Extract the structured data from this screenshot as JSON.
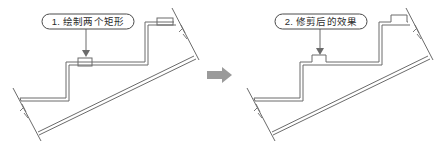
{
  "figure": {
    "background_color": "#ffffff",
    "line_color": "#6b6b6b",
    "dark_line_color": "#555555",
    "label_text_color": "#2b2b2b",
    "arrow_color": "#9a9a9a"
  },
  "panels": [
    {
      "id": "before",
      "step_number": "1.",
      "label": "1. 绘制两个矩形",
      "label_shape": "rounded-capsule",
      "leader": {
        "from": "label-bottom",
        "to": "upper-rectangle",
        "arrowhead": "filled-triangle-down"
      },
      "annotation_rects": [
        {
          "name": "stair-rectangle-upper",
          "trimmed": false
        },
        {
          "name": "stair-rectangle-right",
          "trimmed": false
        }
      ]
    },
    {
      "id": "after",
      "step_number": "2.",
      "label": "2. 修剪后的效果",
      "label_shape": "rounded-capsule",
      "leader": {
        "from": "label-bottom",
        "to": "upper-rectangle",
        "arrowhead": "filled-triangle-down"
      },
      "annotation_rects": [
        {
          "name": "stair-rectangle-upper",
          "trimmed": true
        },
        {
          "name": "stair-rectangle-right",
          "trimmed": true
        }
      ]
    }
  ],
  "transition": {
    "icon": "right-block-arrow",
    "direction": "right",
    "color": "#9a9a9a"
  }
}
